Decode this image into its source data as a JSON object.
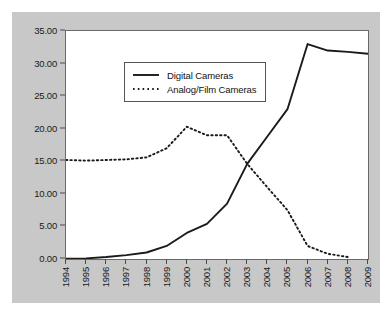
{
  "chart_data": {
    "type": "line",
    "title": "",
    "subtitle": "",
    "xlabel": "",
    "ylabel": "",
    "x": [
      1994,
      1995,
      1996,
      1997,
      1998,
      1999,
      2000,
      2001,
      2002,
      2003,
      2004,
      2005,
      2006,
      2007,
      2008,
      2009
    ],
    "categories": [
      "1994",
      "1995",
      "1996",
      "1997",
      "1998",
      "1999",
      "2000",
      "2001",
      "2002",
      "2003",
      "2004",
      "2005",
      "2006",
      "2007",
      "2008",
      "2009"
    ],
    "xlim": [
      1994,
      2009
    ],
    "ylim": [
      0,
      35
    ],
    "yticks": [
      0,
      5,
      10,
      15,
      20,
      25,
      30,
      35
    ],
    "ytick_labels": [
      "0.00",
      "5.00",
      "10.00",
      "15.00",
      "20.00",
      "25.00",
      "30.00",
      "35.00"
    ],
    "grid": false,
    "legend_position": "top-left",
    "series": [
      {
        "name": "Digital Cameras",
        "style": "solid",
        "color": "#1a1a1a",
        "values": [
          0.05,
          0.1,
          0.3,
          0.6,
          1.0,
          2.0,
          4.0,
          5.4,
          8.5,
          14.6,
          18.8,
          23.0,
          33.0,
          32.0,
          31.8,
          31.5
        ]
      },
      {
        "name": "Analog/Film Cameras",
        "style": "dotted",
        "color": "#1a1a1a",
        "values": [
          15.2,
          15.1,
          15.2,
          15.3,
          15.6,
          17.0,
          20.3,
          19.0,
          19.0,
          14.6,
          11.0,
          7.5,
          2.0,
          0.8,
          0.3,
          null
        ]
      }
    ]
  },
  "legend": {
    "items": [
      {
        "label": "Digital Cameras",
        "style": "solid"
      },
      {
        "label": "Analog/Film Cameras",
        "style": "dotted"
      }
    ]
  },
  "colors": {
    "panel_background": "#c8c8c8",
    "plot_background": "#ffffff",
    "axis": "#4a4a4a",
    "series": "#1a1a1a"
  }
}
